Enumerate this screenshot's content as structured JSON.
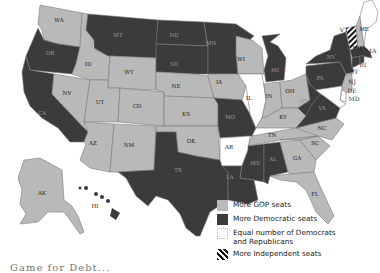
{
  "map": {
    "title": "State legislature party control",
    "colors": {
      "gop": "#b9b9b9",
      "dem": "#3b3b3b",
      "equal": "#ffffff",
      "independent": "striped"
    },
    "states": [
      {
        "abbr": "WA",
        "control": "gop"
      },
      {
        "abbr": "OR",
        "control": "dem"
      },
      {
        "abbr": "CA",
        "control": "dem"
      },
      {
        "abbr": "NV",
        "control": "gop"
      },
      {
        "abbr": "ID",
        "control": "gop"
      },
      {
        "abbr": "MT",
        "control": "dem"
      },
      {
        "abbr": "WY",
        "control": "gop"
      },
      {
        "abbr": "UT",
        "control": "gop"
      },
      {
        "abbr": "AZ",
        "control": "gop"
      },
      {
        "abbr": "CO",
        "control": "gop"
      },
      {
        "abbr": "NM",
        "control": "gop"
      },
      {
        "abbr": "ND",
        "control": "dem"
      },
      {
        "abbr": "SD",
        "control": "dem"
      },
      {
        "abbr": "NE",
        "control": "gop"
      },
      {
        "abbr": "KS",
        "control": "gop"
      },
      {
        "abbr": "OK",
        "control": "gop"
      },
      {
        "abbr": "TX",
        "control": "dem"
      },
      {
        "abbr": "MN",
        "control": "dem"
      },
      {
        "abbr": "IA",
        "control": "gop"
      },
      {
        "abbr": "MO",
        "control": "dem"
      },
      {
        "abbr": "AR",
        "control": "equal"
      },
      {
        "abbr": "LA",
        "control": "dem"
      },
      {
        "abbr": "WI",
        "control": "gop"
      },
      {
        "abbr": "IL",
        "control": "equal"
      },
      {
        "abbr": "MI",
        "control": "dem"
      },
      {
        "abbr": "IN",
        "control": "gop"
      },
      {
        "abbr": "OH",
        "control": "gop"
      },
      {
        "abbr": "KY",
        "control": "gop"
      },
      {
        "abbr": "TN",
        "control": "gop"
      },
      {
        "abbr": "MS",
        "control": "dem"
      },
      {
        "abbr": "AL",
        "control": "dem"
      },
      {
        "abbr": "GA",
        "control": "gop"
      },
      {
        "abbr": "FL",
        "control": "gop"
      },
      {
        "abbr": "SC",
        "control": "gop"
      },
      {
        "abbr": "NC",
        "control": "gop"
      },
      {
        "abbr": "VA",
        "control": "dem"
      },
      {
        "abbr": "WV",
        "control": "dem"
      },
      {
        "abbr": "PA",
        "control": "dem"
      },
      {
        "abbr": "NY",
        "control": "dem"
      },
      {
        "abbr": "VT",
        "control": "independent"
      },
      {
        "abbr": "NH",
        "control": "gop"
      },
      {
        "abbr": "ME",
        "control": "equal"
      },
      {
        "abbr": "MA",
        "control": "dem"
      },
      {
        "abbr": "RI",
        "control": "dem"
      },
      {
        "abbr": "CT",
        "control": "dem"
      },
      {
        "abbr": "NJ",
        "control": "gop"
      },
      {
        "abbr": "DE",
        "control": "equal"
      },
      {
        "abbr": "MD",
        "control": "equal"
      },
      {
        "abbr": "AK",
        "control": "gop"
      },
      {
        "abbr": "HI",
        "control": "dem"
      }
    ],
    "labels": {
      "WA": "WA",
      "OR": "OR",
      "CA": "CA",
      "NV": "NV",
      "ID": "ID",
      "MT": "MT",
      "WY": "WY",
      "UT": "UT",
      "AZ": "AZ",
      "CO": "CO",
      "NM": "NM",
      "ND": "ND",
      "SD": "SD",
      "NE": "NE",
      "KS": "KS",
      "OK": "OK",
      "TX": "TX",
      "MN": "MN",
      "IA": "IA",
      "MO": "MO",
      "AR": "AR",
      "LA": "LA",
      "WI": "WI",
      "IL": "IL",
      "MI": "MI",
      "IN": "IN",
      "OH": "OH",
      "KY": "KY",
      "TN": "TN",
      "MS": "MS",
      "AL": "AL",
      "GA": "GA",
      "FL": "FL",
      "SC": "SC",
      "NC": "NC",
      "VA": "VA",
      "WV": "WV",
      "PA": "PA",
      "NY": "NY",
      "VT": "VT",
      "NH": "NH",
      "ME": "ME",
      "MA": "MA",
      "RI": "RI",
      "CT": "CT",
      "NJ": "NJ",
      "DE": "DE",
      "MD": "MD",
      "AK": "AK",
      "HI": "HI"
    }
  },
  "legend": {
    "items": [
      {
        "key": "gop",
        "label": "More GOP seats"
      },
      {
        "key": "dem",
        "label": "More Democratic seats"
      },
      {
        "key": "equal",
        "label_line1": "Equal number of Democrats",
        "label_line2": "and Republicans"
      },
      {
        "key": "independent",
        "label": "More Independent seats"
      }
    ]
  },
  "caption": {
    "text": "Game for Debt..."
  }
}
